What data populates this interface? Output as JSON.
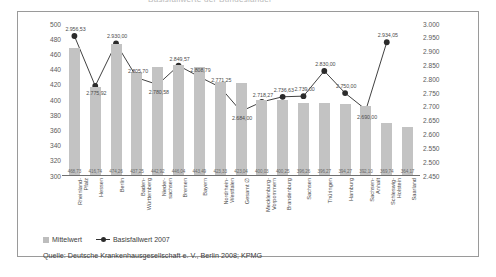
{
  "title": {
    "text": "Basisfallwerte der Bundesländer"
  },
  "frame": {
    "border_color": "#9a9a9a"
  },
  "legend": {
    "items": [
      {
        "label": "Mittelwert",
        "marker": "bar-swatch-icon",
        "color": "#bdbdbd"
      },
      {
        "label": "Basisfallwert 2007",
        "marker": "line-marker-icon",
        "color": "#2b2b2b"
      }
    ]
  },
  "source": {
    "text": "Quelle: Deutsche Krankenhausgesellschaft e. V., Berlin 2008; KPMG"
  },
  "chart_data": {
    "type": "bar",
    "title": "Basisfallwerte der Bundesländer",
    "xlabel": "",
    "ylabel": "",
    "grid": false,
    "legend_position": "bottom-left",
    "categories": [
      "Rheinland-\nPfalz",
      "Hessen",
      "Berlin",
      "Baden-\nWürttemberg",
      "Nieder-\nsachsen",
      "Bremen",
      "Bayern",
      "Nordrhein-\nWestfalen",
      "Gesamt ∅",
      "Mecklenburg-\nVorpommern",
      "Brandenburg",
      "Sachsen",
      "Thüringen",
      "Hamburg",
      "Sachsen-\nAnhalt",
      "Schleswig-\nHolstein",
      "Saarland"
    ],
    "series": [
      {
        "name": "Mittelwert",
        "axis": "left",
        "kind": "bar",
        "color": "#c3c3c3",
        "values": [
          468.73,
          416.74,
          474.26,
          437.25,
          442.92,
          446.04,
          443.49,
          423.33,
          423.04,
          400.03,
          400.25,
          396.26,
          396.27,
          394.27,
          392.1,
          369.74,
          364.17
        ],
        "value_labels": [
          "468,73",
          "416,74",
          "474,26",
          "437,25",
          "442,92",
          "446,04",
          "443,49",
          "423,33",
          "423,04",
          "400,03",
          "400,25",
          "396,26",
          "396,27",
          "394,27",
          "392,10",
          "369,74",
          "364,17"
        ]
      },
      {
        "name": "Basisfallwert 2007",
        "axis": "right",
        "kind": "line",
        "color": "#2b2b2b",
        "values": [
          2956.53,
          2775.92,
          2930.0,
          2805.7,
          2780.58,
          2849.57,
          2808.79,
          2771.25,
          2684.0,
          2718.27,
          2736.63,
          2739.0,
          2830.0,
          2750.0,
          2690.0,
          2934.05,
          null
        ],
        "value_labels": [
          "2.956,53",
          "2.775,92",
          "2.930,00",
          "2.805,70",
          "2.780,58",
          "2.849,57",
          "2.808,79",
          "2.771,25",
          "2.684,00",
          "2.718,27",
          "2.736,63",
          "2.739,00",
          "2.830,00",
          "2.750,00",
          "2.690,00",
          "2.934,05",
          ""
        ]
      }
    ],
    "left_axis": {
      "min": 300,
      "max": 500,
      "step": 20,
      "ticks": [
        "500",
        "480",
        "460",
        "440",
        "420",
        "400",
        "380",
        "360",
        "340",
        "320",
        "300"
      ]
    },
    "right_axis": {
      "min": 2450,
      "max": 3000,
      "step": 50,
      "ticks": [
        "3.000",
        "2.950",
        "2.900",
        "2.850",
        "2.800",
        "2.750",
        "2.700",
        "2.650",
        "2.600",
        "2.550",
        "2.500",
        "2.450"
      ]
    }
  }
}
